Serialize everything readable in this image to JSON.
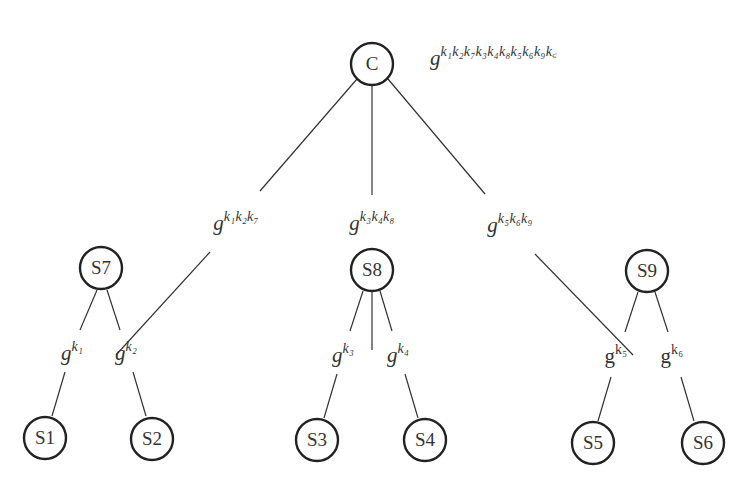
{
  "diagram": {
    "type": "tree",
    "root_key_label": {
      "base": "g",
      "exponent": "k₁k₂k₇k₃k₄k₈k₅k₆k₉k꜀"
    },
    "nodes": {
      "C": {
        "label": "C"
      },
      "S7": {
        "label": "S7"
      },
      "S8": {
        "label": "S8"
      },
      "S9": {
        "label": "S9"
      },
      "S1": {
        "label": "S1"
      },
      "S2": {
        "label": "S2"
      },
      "S3": {
        "label": "S3"
      },
      "S4": {
        "label": "S4"
      },
      "S5": {
        "label": "S5"
      },
      "S6": {
        "label": "S6"
      }
    },
    "edges": {
      "C_S7": {
        "base": "g",
        "exponent": "k₁k₂k₇"
      },
      "C_S8": {
        "base": "g",
        "exponent": "k₃k₄k₈"
      },
      "C_S9": {
        "base": "g",
        "exponent": "k₅k₆k₉"
      },
      "S7_S1": {
        "base": "g",
        "exponent": "k₁"
      },
      "S7_S2": {
        "base": "g",
        "exponent": "k₂"
      },
      "S8_S3": {
        "base": "g",
        "exponent": "k₃"
      },
      "S8_S4": {
        "base": "g",
        "exponent": "k₄"
      },
      "S9_S5": {
        "base": "g",
        "exponent": "k₅"
      },
      "S9_S6": {
        "base": "g",
        "exponent": "k₆"
      }
    }
  }
}
